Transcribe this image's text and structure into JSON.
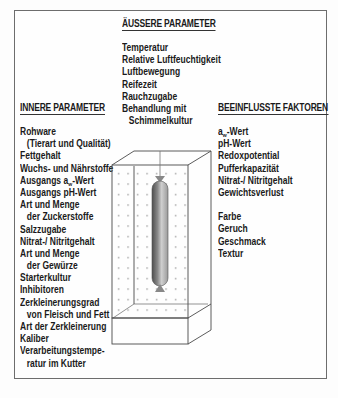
{
  "diagram": {
    "type": "ripening-chamber-parameters",
    "outer_parameters": {
      "title": "ÄUSSERE PARAMETER",
      "items": [
        {
          "text": "Temperatur",
          "indent": false
        },
        {
          "text": "Relative Luftfeuchtigkeit",
          "indent": false
        },
        {
          "text": "Luftbewegung",
          "indent": false
        },
        {
          "text": "Reifezeit",
          "indent": false
        },
        {
          "text": "Rauchzugabe",
          "indent": false
        },
        {
          "text": "Behandlung mit",
          "indent": false
        },
        {
          "text": "Schimmelkultur",
          "indent": true
        }
      ]
    },
    "inner_parameters": {
      "title": "INNERE PARAMETER",
      "items": [
        {
          "text": "Rohware",
          "indent": false
        },
        {
          "text": "(Tierart und Qualität)",
          "indent": true
        },
        {
          "text": "Fettgehalt",
          "indent": false
        },
        {
          "text": "Wuchs- und Nährstoffe",
          "indent": false
        },
        {
          "text": "Ausgangs aw-Wert",
          "indent": false
        },
        {
          "text": "Ausgangs pH-Wert",
          "indent": false
        },
        {
          "text": "Art und Menge",
          "indent": false
        },
        {
          "text": "der Zuckerstoffe",
          "indent": true
        },
        {
          "text": "Salzzugabe",
          "indent": false
        },
        {
          "text": "Nitrat-/ Nitritgehalt",
          "indent": false
        },
        {
          "text": "Art und Menge",
          "indent": false
        },
        {
          "text": "der Gewürze",
          "indent": true
        },
        {
          "text": "Starterkultur",
          "indent": false
        },
        {
          "text": "Inhibitoren",
          "indent": false
        },
        {
          "text": "Zerkleinerungsgrad",
          "indent": false
        },
        {
          "text": "von Fleisch und Fett",
          "indent": true
        },
        {
          "text": "Art der Zerkleinerung",
          "indent": false
        },
        {
          "text": "Kaliber",
          "indent": false
        },
        {
          "text": "Verarbeitungstempe-",
          "indent": false
        },
        {
          "text": "ratur im Kutter",
          "indent": true
        }
      ]
    },
    "influenced_factors": {
      "title": "BEEINFLUSSTE FAKTOREN",
      "group1": [
        "aw-Wert",
        "pH-Wert",
        "Redoxpotential",
        "Pufferkapazität",
        "Nitrat-/ Nitritgehalt",
        "Gewichtsverlust"
      ],
      "group2": [
        "Farbe",
        "Geruch",
        "Geschmack",
        "Textur"
      ]
    },
    "center_figure": {
      "label": "Reifekammer mit hängender Wurst",
      "sausage_color_dark": "#5a5a5a",
      "sausage_color_light": "#d8d8d8"
    }
  }
}
